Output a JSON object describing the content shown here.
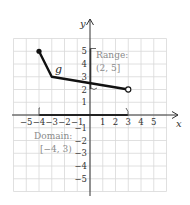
{
  "chart_data": {
    "type": "line",
    "title": "",
    "xlabel": "x",
    "ylabel": "y",
    "xlim": [
      -6,
      6
    ],
    "ylim": [
      -6,
      6
    ],
    "grid": true,
    "x_ticks": [
      -5,
      -4,
      -3,
      -2,
      -1,
      1,
      2,
      3,
      4,
      5
    ],
    "y_ticks": [
      -5,
      -4,
      -3,
      -2,
      -1,
      1,
      2,
      3,
      4,
      5
    ],
    "series": [
      {
        "name": "g",
        "points": [
          [
            -4,
            5
          ],
          [
            -3,
            3
          ],
          [
            3,
            2
          ]
        ],
        "start_point": {
          "x": -4,
          "y": 5,
          "style": "closed"
        },
        "end_point": {
          "x": 3,
          "y": 2,
          "style": "open"
        }
      }
    ],
    "annotations": [
      {
        "label": "Range:",
        "value": "(2, 5]",
        "interval_axis": "y",
        "interval": [
          2,
          5
        ],
        "left_closed": false,
        "right_closed": true
      },
      {
        "label": "Domain:",
        "value": "[−4, 3)",
        "interval_axis": "x",
        "interval": [
          -4,
          3
        ],
        "left_closed": true,
        "right_closed": false
      }
    ]
  },
  "labels": {
    "x_axis": "x",
    "y_axis": "y",
    "function": "g",
    "range_title": "Range:",
    "range_value": "(2, 5]",
    "domain_title": "Domain:",
    "domain_value": "[−4, 3)",
    "x_ticks": [
      "−5",
      "−4",
      "−3",
      "−2",
      "−1",
      "1",
      "2",
      "3",
      "4",
      "5"
    ],
    "y_ticks": [
      "5",
      "4",
      "3",
      "2",
      "1",
      "−1",
      "−2",
      "−3",
      "−4",
      "−5"
    ]
  }
}
